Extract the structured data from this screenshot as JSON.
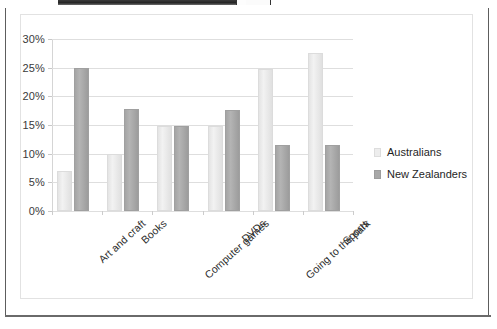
{
  "frame": {
    "outer_border_color": "#5d5d5d",
    "chart_border_color": "#e2e2e2",
    "background": "#ffffff"
  },
  "legend": {
    "position": "right",
    "entries": [
      {
        "label": "Australians",
        "color": "#ededed"
      },
      {
        "label": "New Zealanders",
        "color": "#a8a8a8"
      }
    ]
  },
  "chart_data": {
    "type": "bar",
    "title": "",
    "xlabel": "",
    "ylabel": "",
    "ylim": [
      0,
      30
    ],
    "ytick_labels": [
      "0%",
      "5%",
      "10%",
      "15%",
      "20%",
      "25%",
      "30%"
    ],
    "ytick_values": [
      0,
      5,
      10,
      15,
      20,
      25,
      30
    ],
    "grid": true,
    "legend_position": "right",
    "categories": [
      "Art and craft",
      "Books",
      "Computer games",
      "DVDs",
      "Going to the park",
      "Sports"
    ],
    "series": [
      {
        "name": "Australians",
        "color": "#ededed",
        "values": [
          7.0,
          10.0,
          14.8,
          14.8,
          24.8,
          27.5
        ]
      },
      {
        "name": "New Zealanders",
        "color": "#a8a8a8",
        "values": [
          25.0,
          17.8,
          14.8,
          17.7,
          11.6,
          11.5
        ]
      }
    ]
  }
}
